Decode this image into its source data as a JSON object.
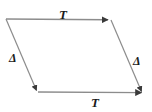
{
  "figure": {
    "type": "parallelogram-diagram",
    "background_color": "#ffffff",
    "stroke_color": "#808080",
    "arrow_color": "#3a3a3a",
    "label_color": "#1a1a1a",
    "width": 152,
    "height": 112,
    "vertices": {
      "top_left": {
        "x": 6,
        "y": 19
      },
      "top_right": {
        "x": 111,
        "y": 20
      },
      "bottom_right": {
        "x": 143,
        "y": 93
      },
      "bottom_left": {
        "x": 38,
        "y": 92
      }
    },
    "edges": [
      {
        "name": "top-edge",
        "label": "T",
        "from": "top_left",
        "to": "top_right",
        "arrow_at": "to",
        "direction": "rightward"
      },
      {
        "name": "right-edge",
        "label": "Δ",
        "from": "top_right",
        "to": "bottom_right",
        "arrow_at": "to",
        "direction": "down-right"
      },
      {
        "name": "bottom-edge",
        "label": "T",
        "from": "bottom_left",
        "to": "bottom_right",
        "arrow_at": "to",
        "direction": "rightward"
      },
      {
        "name": "left-edge",
        "label": "Δ",
        "from": "top_left",
        "to": "bottom_left",
        "arrow_at": "to",
        "direction": "down-right"
      }
    ],
    "labels": {
      "top": "T",
      "bottom": "T",
      "left": "Δ",
      "right": "Δ"
    }
  }
}
